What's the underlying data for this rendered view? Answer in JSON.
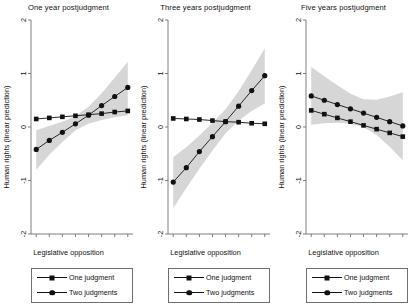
{
  "figure": {
    "axis_label_x": "Legislative opposition",
    "axis_label_y": "Human rights (linear prediction)",
    "legend": {
      "items": [
        {
          "label": "One judgment",
          "marker": "square"
        },
        {
          "label": "Two judgments",
          "marker": "circle"
        }
      ]
    },
    "ticks": {
      "x": [
        "0",
        "0.1",
        "0.2",
        "0.3",
        "0.4",
        "0.5",
        "0.6",
        "0.7"
      ],
      "y": [
        "2",
        "1",
        "0",
        "-1",
        "-2"
      ]
    },
    "colors": {
      "line": "#111111",
      "ci_band": "#d6d6d6",
      "axis": "#6f6f6f"
    }
  },
  "chart_data": [
    {
      "type": "line",
      "title": "One year postjudgment",
      "xlabel": "Legislative opposition",
      "ylabel": "Human rights (linear prediction)",
      "x": [
        0,
        0.1,
        0.2,
        0.3,
        0.4,
        0.5,
        0.6,
        0.7
      ],
      "xlim": [
        -0.04,
        0.74
      ],
      "ylim": [
        -2,
        2
      ],
      "xticks": [
        0,
        0.1,
        0.2,
        0.3,
        0.4,
        0.5,
        0.6,
        0.7
      ],
      "yticks": [
        -2,
        -1,
        0,
        1,
        2
      ],
      "grid": false,
      "legend_position": "below",
      "series": [
        {
          "name": "One judgment",
          "marker": "square",
          "values": [
            0.15,
            0.17,
            0.19,
            0.21,
            0.23,
            0.25,
            0.28,
            0.3
          ],
          "ci_lower": [
            0.15,
            0.17,
            0.19,
            0.21,
            0.23,
            0.25,
            0.28,
            0.3
          ],
          "ci_upper": [
            0.15,
            0.17,
            0.19,
            0.21,
            0.23,
            0.25,
            0.28,
            0.3
          ]
        },
        {
          "name": "Two judgments",
          "marker": "circle",
          "values": [
            -0.42,
            -0.25,
            -0.1,
            0.06,
            0.22,
            0.4,
            0.57,
            0.74
          ],
          "ci_lower": [
            -0.8,
            -0.52,
            -0.28,
            -0.06,
            0.06,
            0.13,
            0.18,
            0.22
          ],
          "ci_upper": [
            -0.06,
            0.02,
            0.1,
            0.2,
            0.38,
            0.63,
            0.92,
            1.22
          ]
        }
      ]
    },
    {
      "type": "line",
      "title": "Three years postjudgment",
      "xlabel": "Legislative opposition",
      "ylabel": "Human rights (linear prediction)",
      "x": [
        0,
        0.1,
        0.2,
        0.3,
        0.4,
        0.5,
        0.6,
        0.7
      ],
      "xlim": [
        -0.04,
        0.74
      ],
      "ylim": [
        -2,
        2
      ],
      "xticks": [
        0,
        0.1,
        0.2,
        0.3,
        0.4,
        0.5,
        0.6,
        0.7
      ],
      "yticks": [
        -2,
        -1,
        0,
        1,
        2
      ],
      "grid": false,
      "legend_position": "below",
      "series": [
        {
          "name": "One judgment",
          "marker": "square",
          "values": [
            0.16,
            0.15,
            0.14,
            0.12,
            0.1,
            0.09,
            0.07,
            0.06
          ],
          "ci_lower": [
            0.16,
            0.15,
            0.14,
            0.12,
            0.1,
            0.09,
            0.07,
            0.06
          ],
          "ci_upper": [
            0.16,
            0.15,
            0.14,
            0.12,
            0.1,
            0.09,
            0.07,
            0.06
          ]
        },
        {
          "name": "Two judgments",
          "marker": "circle",
          "values": [
            -1.03,
            -0.76,
            -0.46,
            -0.18,
            0.1,
            0.39,
            0.68,
            0.96
          ],
          "ci_lower": [
            -1.52,
            -1.14,
            -0.78,
            -0.44,
            -0.12,
            0.12,
            0.3,
            0.44
          ],
          "ci_upper": [
            -0.56,
            -0.38,
            -0.16,
            0.08,
            0.33,
            0.67,
            1.06,
            1.47
          ]
        }
      ]
    },
    {
      "type": "line",
      "title": "Five years postjudgment",
      "xlabel": "Legislative opposition",
      "ylabel": "Human rights (linear prediction)",
      "x": [
        0,
        0.1,
        0.2,
        0.3,
        0.4,
        0.5,
        0.6,
        0.7
      ],
      "xlim": [
        -0.04,
        0.74
      ],
      "ylim": [
        -2,
        2
      ],
      "xticks": [
        0,
        0.1,
        0.2,
        0.3,
        0.4,
        0.5,
        0.6,
        0.7
      ],
      "yticks": [
        -2,
        -1,
        0,
        1,
        2
      ],
      "grid": false,
      "legend_position": "below",
      "series": [
        {
          "name": "One judgment",
          "marker": "square",
          "values": [
            0.31,
            0.24,
            0.17,
            0.1,
            0.03,
            -0.04,
            -0.11,
            -0.18
          ],
          "ci_lower": [
            0.31,
            0.24,
            0.17,
            0.1,
            0.03,
            -0.04,
            -0.11,
            -0.18
          ],
          "ci_upper": [
            0.31,
            0.24,
            0.17,
            0.1,
            0.03,
            -0.04,
            -0.11,
            -0.18
          ]
        },
        {
          "name": "Two judgments",
          "marker": "circle",
          "values": [
            0.58,
            0.5,
            0.42,
            0.34,
            0.26,
            0.18,
            0.1,
            0.02
          ],
          "ci_lower": [
            0.04,
            0.07,
            0.08,
            0.06,
            0.0,
            -0.15,
            -0.37,
            -0.62
          ],
          "ci_upper": [
            1.12,
            0.95,
            0.78,
            0.62,
            0.52,
            0.51,
            0.57,
            0.65
          ]
        }
      ]
    }
  ]
}
